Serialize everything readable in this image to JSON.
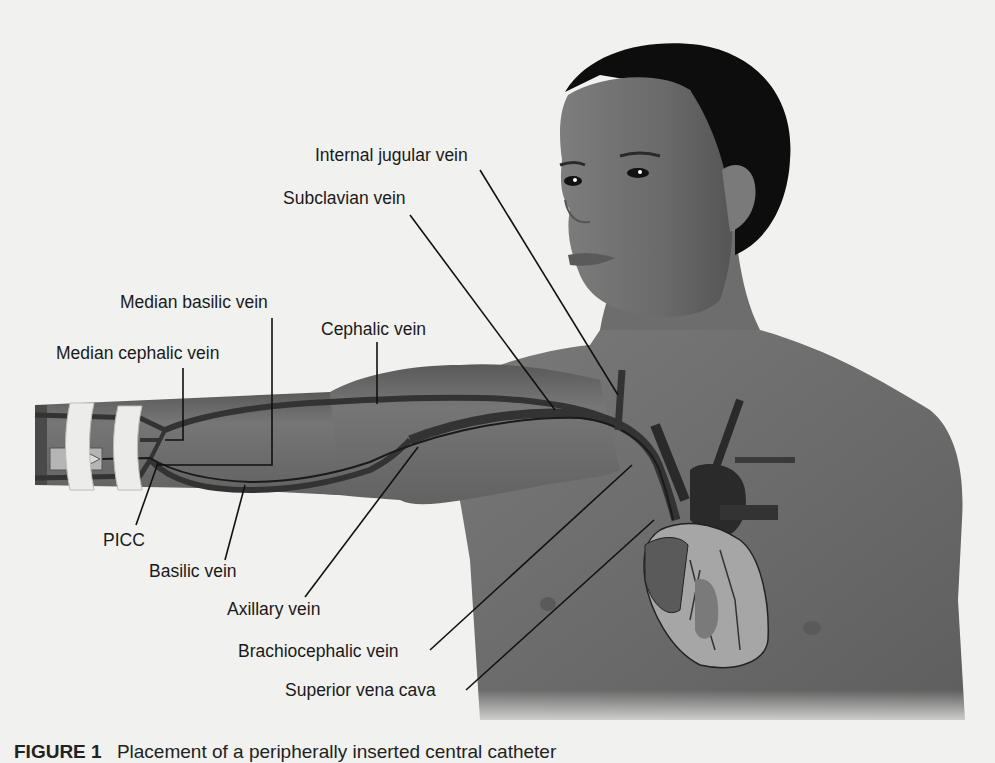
{
  "figure": {
    "caption_number": "FIGURE 1",
    "caption_text": "Placement of a peripherally inserted central catheter"
  },
  "labels": {
    "internal_jugular": "Internal jugular vein",
    "subclavian": "Subclavian vein",
    "median_basilic": "Median basilic vein",
    "cephalic": "Cephalic vein",
    "median_cephalic": "Median cephalic vein",
    "picc": "PICC",
    "basilic": "Basilic vein",
    "axillary": "Axillary vein",
    "brachiocephalic": "Brachiocephalic vein",
    "superior_vena_cava": "Superior vena cava"
  },
  "colors": {
    "background": "#f1f1ef",
    "skin": "#6f6f6f",
    "skin_light": "#858585",
    "hair": "#0d0d0d",
    "vein": "#3a3a3a",
    "heart_light": "#b8b8b8",
    "tape": "#ececea"
  }
}
